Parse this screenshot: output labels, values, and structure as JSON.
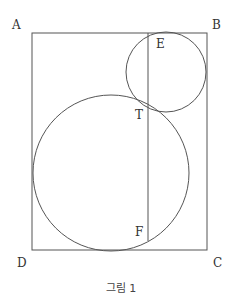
{
  "figure": {
    "caption": "그림 1",
    "stroke_color": "#555555",
    "labels": {
      "A": "A",
      "B": "B",
      "C": "C",
      "D": "D",
      "E": "E",
      "T": "T",
      "F": "F"
    },
    "rectangle": {
      "x": 32,
      "y": 33,
      "width": 175,
      "height": 217
    },
    "small_circle": {
      "cx": 166,
      "cy": 72,
      "r": 40
    },
    "large_circle": {
      "cx": 111,
      "cy": 173,
      "r": 78
    },
    "segment_EF": {
      "x": 148,
      "y1": 33,
      "y2": 241
    }
  }
}
